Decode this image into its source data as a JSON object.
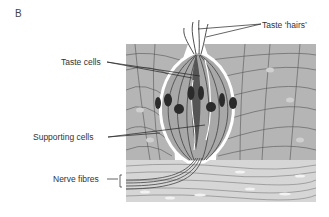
{
  "figure": {
    "panel_label": "B",
    "labels": {
      "taste_hairs": "Taste ‘hairs’",
      "taste_cells": "Taste cells",
      "supporting_cells": "Supporting cells",
      "nerve_fibres": "Nerve fibres"
    },
    "colors": {
      "tissue_fill": "#b8b8b8",
      "bud_fill": "#a9a9a9",
      "nucleus_fill": "#2b2b2b",
      "line_color": "#333333",
      "lower_layer_fill": "#d4d4d4"
    }
  }
}
